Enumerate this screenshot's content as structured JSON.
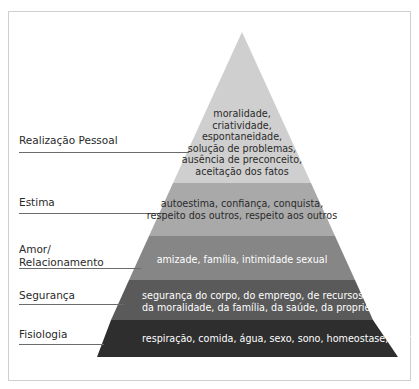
{
  "colors": {
    "frame": "#cfcfcf",
    "layer_realizacao": "#cfcfcf",
    "layer_estima": "#a9a9a9",
    "layer_amor": "#868686",
    "layer_seguranca": "#5a5a5a",
    "layer_fisiologia": "#2e2e2e",
    "text_dark": "#2a2a2a",
    "text_light": "#ffffff"
  },
  "levels": [
    {
      "label": "Realização Pessoal",
      "lines": [
        "moralidade,",
        "criatividade,",
        "espontaneidade,",
        "solução de problemas,",
        "ausência de preconceito,",
        "aceitação dos fatos"
      ]
    },
    {
      "label": "Estima",
      "lines": [
        "autoestima, confiança, conquista,",
        "respeito dos outros, respeito aos outros"
      ]
    },
    {
      "label_lines": [
        "Amor/",
        "Relacionamento"
      ],
      "lines": [
        "amizade, família, intimidade sexual"
      ]
    },
    {
      "label": "Segurança",
      "lines": [
        "segurança do corpo, do emprego, de recursos,",
        "da moralidade, da família, da saúde, da propriedade"
      ]
    },
    {
      "label": "Fisiologia",
      "lines": [
        "respiração, comida, água, sexo, sono, homeostase, excreção"
      ]
    }
  ]
}
